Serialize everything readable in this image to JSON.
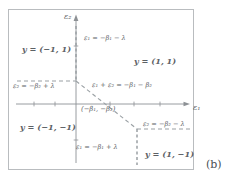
{
  "figure": {
    "caption": "(b)",
    "axes": {
      "x_label": "ε₁",
      "y_label": "ε₂",
      "origin_point_label": "(−β₁, −β₂)"
    },
    "regions": [
      {
        "name": "top-left",
        "label": "y = (−1, 1)"
      },
      {
        "name": "top-right",
        "label": "y = (1, 1)"
      },
      {
        "name": "bottom-left",
        "label": "y = (−1, −1)"
      },
      {
        "name": "bottom-right",
        "label": "y = (1, −1)"
      }
    ],
    "boundaries": [
      {
        "name": "upper-vertical-dashed",
        "label": "ε₁ = −β₁ − λ"
      },
      {
        "name": "left-horizontal-dashed",
        "label": "ε₂ = −β₂ + λ"
      },
      {
        "name": "diagonal-dashed",
        "label": "ε₁ + ε₂ = −β₁ − β₂"
      },
      {
        "name": "right-horizontal-dashed",
        "label": "ε₂ = −β₂ − λ"
      },
      {
        "name": "lower-vertical-dashed",
        "label": "ε₁ = −β₁ + λ"
      }
    ],
    "colors": {
      "frame": "#b9bcbf",
      "axis": "#8d9195",
      "dashed": "#9aa0a4",
      "text": "#5c6165"
    }
  }
}
